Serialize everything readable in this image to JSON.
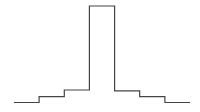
{
  "chart_data": {
    "type": "line",
    "subtype": "step",
    "title": "",
    "xlabel": "",
    "ylabel": "",
    "grid": false,
    "legend": "none",
    "x_edges": [
      0,
      1,
      2,
      3,
      4,
      5,
      6,
      7
    ],
    "series": [
      {
        "name": "profile",
        "values": [
          0,
          0.06,
          0.13,
          1.0,
          0.12,
          0.06,
          0.0
        ],
        "color": "#444444"
      }
    ],
    "ylim": [
      0,
      1
    ]
  }
}
